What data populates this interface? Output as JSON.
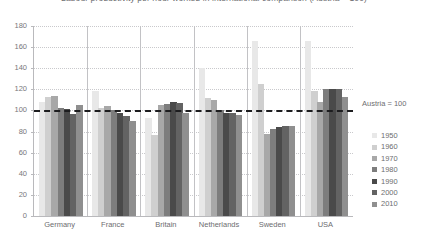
{
  "chart_data": {
    "type": "bar",
    "title": "Labour productivity per hour worked in international comparison (Austria = 100)",
    "xlabel": "",
    "ylabel": "",
    "ylim": [
      0,
      180
    ],
    "ytick_step": 20,
    "yticks": [
      0,
      20,
      40,
      60,
      80,
      100,
      120,
      140,
      160,
      180
    ],
    "grid": true,
    "legend_position": "right",
    "categories": [
      "Germany",
      "France",
      "Britain",
      "Netherlands",
      "Sweden",
      "USA"
    ],
    "series": [
      {
        "name": "1950",
        "color": "#e8e8e8",
        "values": [
          108,
          118,
          93,
          140,
          166,
          166
        ]
      },
      {
        "name": "1960",
        "color": "#cfcfcf",
        "values": [
          113,
          102,
          77,
          112,
          125,
          118
        ]
      },
      {
        "name": "1970",
        "color": "#a8a8a8",
        "values": [
          114,
          104,
          105,
          110,
          78,
          108
        ]
      },
      {
        "name": "1980",
        "color": "#7d7d7d",
        "values": [
          102,
          100,
          106,
          100,
          82,
          120
        ]
      },
      {
        "name": "1990",
        "color": "#4a4a4a",
        "values": [
          101,
          98,
          108,
          98,
          84,
          120
        ]
      },
      {
        "name": "2000",
        "color": "#636363",
        "values": [
          97,
          95,
          107,
          98,
          85,
          120
        ]
      },
      {
        "name": "2010",
        "color": "#8f8f8f",
        "values": [
          105,
          90,
          98,
          96,
          85,
          113
        ]
      }
    ],
    "annotations": [
      {
        "name": "austria-reference",
        "text": "Austria = 100",
        "value": 100,
        "style": "dashed"
      }
    ]
  }
}
